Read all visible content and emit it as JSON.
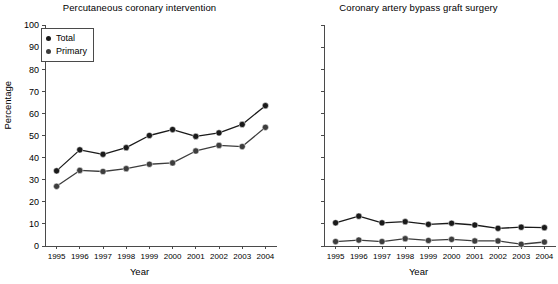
{
  "chart_data": [
    {
      "type": "line",
      "title": "Percutaneous coronary intervention",
      "xlabel": "Year",
      "ylabel": "Percentage",
      "x": [
        1995,
        1996,
        1997,
        1998,
        1999,
        2000,
        2001,
        2002,
        2003,
        2004
      ],
      "xticklabels": [
        "1995",
        "1996",
        "1997",
        "1998",
        "1999",
        "2000",
        "2001",
        "2002",
        "2003",
        "2004"
      ],
      "yticklabels": [
        "0",
        "10",
        "20",
        "30",
        "40",
        "50",
        "60",
        "70",
        "80",
        "90",
        "100"
      ],
      "ylim": [
        0,
        100
      ],
      "yticks": [
        0,
        10,
        20,
        30,
        40,
        50,
        60,
        70,
        80,
        90,
        100
      ],
      "grid": false,
      "legend_position": "top-left",
      "series": [
        {
          "name": "Total",
          "color": "#1a1a1a",
          "values": [
            34.0,
            43.5,
            41.5,
            44.5,
            50.0,
            52.7,
            49.6,
            51.2,
            55.0,
            63.5
          ]
        },
        {
          "name": "Primary",
          "color": "#3d3d3d",
          "values": [
            27.0,
            34.2,
            33.7,
            35.0,
            37.0,
            37.6,
            43.0,
            45.5,
            45.0,
            53.7
          ]
        }
      ]
    },
    {
      "type": "line",
      "title": "Coronary artery bypass graft surgery",
      "xlabel": "Year",
      "ylabel": "",
      "x": [
        1995,
        1996,
        1997,
        1998,
        1999,
        2000,
        2001,
        2002,
        2003,
        2004
      ],
      "xticklabels": [
        "1995",
        "1996",
        "1997",
        "1998",
        "1999",
        "2000",
        "2001",
        "2002",
        "2003",
        "2004"
      ],
      "yticklabels": [
        "",
        "",
        "",
        "",
        "",
        "",
        "",
        "",
        "",
        "",
        ""
      ],
      "ylim": [
        0,
        100
      ],
      "yticks": [
        0,
        10,
        20,
        30,
        40,
        50,
        60,
        70,
        80,
        90,
        100
      ],
      "grid": false,
      "legend_position": "top-left",
      "series": [
        {
          "name": "Total",
          "color": "#1a1a1a",
          "values": [
            10.5,
            13.5,
            10.5,
            11.0,
            9.8,
            10.3,
            9.5,
            8.0,
            8.5,
            8.3
          ]
        },
        {
          "name": "Immediate",
          "color": "#3d3d3d",
          "values": [
            2.0,
            2.7,
            2.0,
            3.3,
            2.5,
            3.0,
            2.3,
            2.3,
            0.8,
            1.8
          ]
        }
      ]
    }
  ]
}
